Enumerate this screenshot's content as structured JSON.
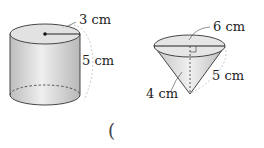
{
  "figures": {
    "cylinder": {
      "radius_label": "3 cm",
      "height_label": "5 cm"
    },
    "cone": {
      "diameter_label": "6 cm",
      "slant_label": "5 cm",
      "height_label": "4 cm"
    }
  },
  "answer_blank": {
    "open_paren": "("
  }
}
